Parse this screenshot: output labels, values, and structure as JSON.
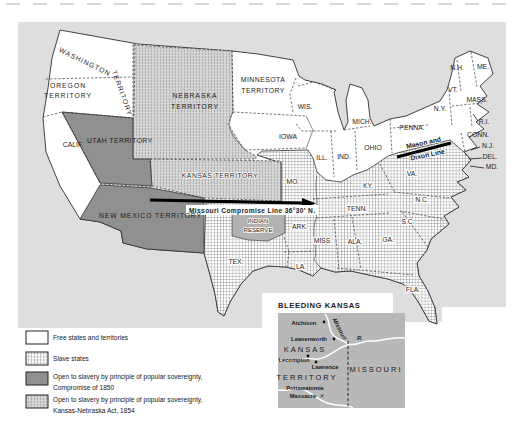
{
  "colors": {
    "sea_background": "#dedede",
    "free_states": "#ffffff",
    "popular_sovereignty_1850": "#909090",
    "kansas_nebraska_stripe_bg": "#d6d6d6",
    "slave_states_hatch": "#5a5a5a",
    "indian_reserve": "#b2b2b2",
    "inset_background": "#b8b8b8",
    "line_black": "#000000"
  },
  "map": {
    "labels": {
      "washington_1": "WASHINGTON",
      "washington_2": "TERRITORY",
      "oregon_1": "OREGON",
      "oregon_2": "TERRITORY",
      "calif": "CALIF.",
      "utah": "UTAH TERRITORY",
      "new_mexico": "NEW MEXICO TERRITORY",
      "nebraska_1": "NEBRASKA",
      "nebraska_2": "TERRITORY",
      "minnesota_1": "MINNESOTA",
      "minnesota_2": "TERRITORY",
      "kansas": "KANSAS TERRITORY",
      "indian_1": "INDIAN",
      "indian_2": "RESERVE",
      "iowa": "IOWA",
      "wis": "WIS.",
      "mich": "MICH.",
      "ill": "ILL.",
      "ind": "IND.",
      "ohio": "OHIO",
      "mo": "MO.",
      "ky": "KY.",
      "tenn": "TENN.",
      "va": "VA.",
      "nc": "N.C.",
      "sc": "S.C.",
      "ga": "GA.",
      "ala": "ALA.",
      "miss": "MISS.",
      "ark": "ARK.",
      "la": "LA.",
      "tex": "TEX.",
      "fla": "FLA.",
      "penna": "PENNA.",
      "ny": "N.Y.",
      "nh": "N.H.",
      "me": "ME.",
      "vt": "VT.",
      "mass": "MASS.",
      "ri": "R.I.",
      "conn": "CONN.",
      "nj": "N.J.",
      "del": "DEL.",
      "md": "MD."
    },
    "annotations": {
      "compromise_line": "Missouri Compromise Line 36°30′ N.",
      "mason_1": "Mason and",
      "mason_2": "Dixon Line"
    }
  },
  "inset": {
    "title": "BLEEDING KANSAS",
    "labels": {
      "kansas": "KANSAS",
      "territory": "TERRITORY",
      "missouri": "MISSOURI",
      "atchison": "Atchison",
      "leavenworth": "Leavenworth",
      "lecompton": "Lecompton",
      "lawrence": "Lawrence",
      "pottawatomie_1": "Pottawatomie",
      "pottawatomie_2": "Massacre",
      "massacre_marker": "✕",
      "river": "Missouri",
      "river_suffix": "R."
    }
  },
  "legend": {
    "items": [
      {
        "key": "free",
        "line1": "Free states and territories",
        "line2": ""
      },
      {
        "key": "slave",
        "line1": "Slave states",
        "line2": ""
      },
      {
        "key": "sovereignty_1850",
        "line1": "Open to slavery by principle of popular sovereignty,",
        "line2": "Compromise of 1850"
      },
      {
        "key": "kansas_nebraska_1854",
        "line1": "Open to slavery by principle of popular sovereignty,",
        "line2": "Kansas-Nebraska Act, 1854"
      }
    ]
  }
}
